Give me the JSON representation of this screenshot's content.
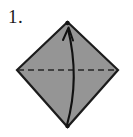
{
  "figure": {
    "kind": "origami-fold-step",
    "step_label": "1.",
    "canvas": {
      "width": 133,
      "height": 137
    },
    "colors": {
      "background": "#ffffff",
      "paper_fill": "#959595",
      "paper_outline": "#1c1c1c",
      "fold_line": "#262626",
      "arrow": "#111111",
      "label_text": "#1a1a1a"
    },
    "shape": {
      "name": "diamond",
      "vertices": {
        "top": {
          "x": 67.5,
          "y": 22
        },
        "right": {
          "x": 118,
          "y": 70
        },
        "bottom": {
          "x": 67.5,
          "y": 127
        },
        "left": {
          "x": 17,
          "y": 70
        }
      },
      "outline_width": 2.2
    },
    "fold_line": {
      "name": "valley-fold-dashed-line",
      "from": {
        "x": 17,
        "y": 70
      },
      "to": {
        "x": 118,
        "y": 70
      },
      "style": "dashed",
      "dash": "6 4",
      "width": 1.6
    },
    "arrow": {
      "name": "fold-direction-arrow",
      "from": {
        "x": 67,
        "y": 125
      },
      "to": {
        "x": 68,
        "y": 27
      },
      "control": {
        "x": 80,
        "y": 78
      },
      "head": "open-barb",
      "width": 2.1
    },
    "vertex_dots": [
      {
        "name": "top-vertex-dot",
        "x": 67.5,
        "y": 23,
        "r": 2.2
      },
      {
        "name": "bottom-vertex-dot",
        "x": 67.5,
        "y": 126,
        "r": 2.2
      }
    ]
  }
}
